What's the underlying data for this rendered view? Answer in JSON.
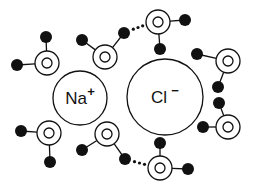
{
  "diagram": {
    "title": "",
    "ions": [
      {
        "id": "sodium",
        "symbol": "Na",
        "charge": "+",
        "cx": 80,
        "cy": 98,
        "r": 27
      },
      {
        "id": "chloride",
        "symbol": "Cl",
        "charge": "−",
        "cx": 165,
        "cy": 97,
        "r": 38
      }
    ],
    "water_molecules": [
      {
        "id": "w1",
        "o": [
          47,
          63
        ],
        "h": [
          [
            17,
            65
          ],
          [
            46,
            37
          ]
        ]
      },
      {
        "id": "w2",
        "o": [
          105,
          57
        ],
        "h": [
          [
            82,
            40
          ],
          [
            124,
            33
          ]
        ]
      },
      {
        "id": "w3",
        "o": [
          158,
          22
        ],
        "h": [
          [
            185,
            20
          ],
          [
            160,
            49
          ]
        ]
      },
      {
        "id": "w4",
        "o": [
          228,
          61
        ],
        "h": [
          [
            197,
            54
          ],
          [
            218,
            87
          ]
        ]
      },
      {
        "id": "w5",
        "o": [
          49,
          133
        ],
        "h": [
          [
            21,
            131
          ],
          [
            50,
            162
          ]
        ]
      },
      {
        "id": "w6",
        "o": [
          107,
          134
        ],
        "h": [
          [
            82,
            150
          ],
          [
            125,
            159
          ]
        ]
      },
      {
        "id": "w7",
        "o": [
          160,
          168
        ],
        "h": [
          [
            160,
            143
          ],
          [
            188,
            169
          ]
        ]
      },
      {
        "id": "w8",
        "o": [
          228,
          127
        ],
        "h": [
          [
            219,
            103
          ],
          [
            203,
            127
          ]
        ]
      }
    ],
    "hydrogen_bonds": [
      {
        "from": [
          131,
          30
        ],
        "to": [
          145,
          25
        ]
      },
      {
        "from": [
          132,
          161
        ],
        "to": [
          147,
          165
        ]
      }
    ],
    "colors": {
      "stroke": "#111111",
      "hydrogen": "#111111",
      "background": "#ffffff"
    }
  }
}
